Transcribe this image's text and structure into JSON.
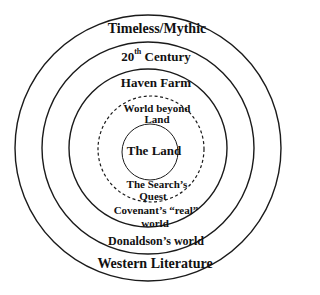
{
  "diagram": {
    "type": "concentric-circles",
    "circles": [
      {
        "name": "outer",
        "cx": 148,
        "cy": 148,
        "r": 133,
        "style": "solid"
      },
      {
        "name": "second",
        "cx": 148,
        "cy": 148,
        "r": 106,
        "style": "solid"
      },
      {
        "name": "third",
        "cx": 148,
        "cy": 148,
        "r": 79,
        "style": "solid"
      },
      {
        "name": "dashed",
        "cx": 151,
        "cy": 149,
        "r": 53,
        "style": "dashed"
      },
      {
        "name": "inner",
        "cx": 150,
        "cy": 152,
        "r": 28,
        "style": "solid"
      }
    ],
    "labels": {
      "timeless": "Timeless/Mythic",
      "century_num": "20",
      "century_sup": "th",
      "century_word": "Century",
      "haven": "Haven Farm",
      "beyond_line1": "World beyond",
      "beyond_line2": "Land",
      "the_land": "The Land",
      "search_line1": "The Search’s",
      "search_line2": "Quest",
      "covenant_line1": "Covenant’s “real”",
      "covenant_line2": "world",
      "donaldson": "Donaldson’s world",
      "western": "Western Literature"
    },
    "colors": {
      "stroke": "#1a1a1a",
      "text": "#111111",
      "background": "#ffffff"
    }
  }
}
